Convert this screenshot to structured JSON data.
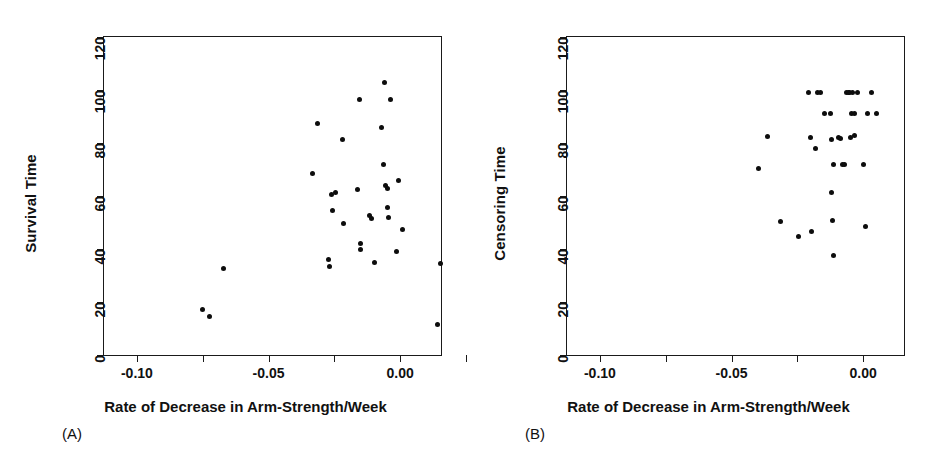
{
  "figure": {
    "panels": [
      {
        "tag": "(A)",
        "ylabel": "Survival Time",
        "xlabel": "Rate of Decrease in Arm-Strength/Week"
      },
      {
        "tag": "(B)",
        "ylabel": "Censoring Time",
        "xlabel": "Rate of Decrease in Arm-Strength/Week"
      }
    ]
  },
  "chart_data": [
    {
      "type": "scatter",
      "panel": "(A)",
      "title": "",
      "xlabel": "Rate of Decrease in Arm-Strength/Week",
      "ylabel": "Survival Time",
      "xlim": [
        -0.1125,
        0.0155
      ],
      "ylim": [
        0,
        120
      ],
      "xticks": [
        -0.1,
        -0.075,
        -0.05,
        -0.025,
        0.0,
        0.025
      ],
      "xticklabels": [
        "-0.10",
        "",
        "-0.05",
        "",
        "0.00",
        ""
      ],
      "yticks": [
        0,
        20,
        40,
        60,
        80,
        100,
        120
      ],
      "yticklabels": [
        "0",
        "20",
        "40",
        "60",
        "80",
        "100",
        "120"
      ],
      "grid": false,
      "legend": null,
      "marker": "filled-circle",
      "marker_color": "#0d0d0d",
      "points": [
        {
          "x": -0.0752,
          "y": 17.0
        },
        {
          "x": -0.0723,
          "y": 14.5
        },
        {
          "x": -0.0672,
          "y": 32.5
        },
        {
          "x": -0.0334,
          "y": 68.5
        },
        {
          "x": -0.0313,
          "y": 87.5
        },
        {
          "x": -0.0271,
          "y": 36.0
        },
        {
          "x": -0.0269,
          "y": 33.5
        },
        {
          "x": -0.0261,
          "y": 60.5
        },
        {
          "x": -0.0256,
          "y": 54.5
        },
        {
          "x": -0.0245,
          "y": 61.5
        },
        {
          "x": -0.0219,
          "y": 81.5
        },
        {
          "x": -0.0214,
          "y": 49.5
        },
        {
          "x": -0.0161,
          "y": 62.5
        },
        {
          "x": -0.0155,
          "y": 96.5
        },
        {
          "x": -0.0151,
          "y": 42.0
        },
        {
          "x": -0.0149,
          "y": 40.0
        },
        {
          "x": -0.0116,
          "y": 52.5
        },
        {
          "x": -0.011,
          "y": 51.5
        },
        {
          "x": -0.0098,
          "y": 34.8
        },
        {
          "x": -0.0071,
          "y": 86.0
        },
        {
          "x": -0.0064,
          "y": 72.0
        },
        {
          "x": -0.0059,
          "y": 103.0
        },
        {
          "x": -0.0055,
          "y": 64.0
        },
        {
          "x": -0.005,
          "y": 63.0
        },
        {
          "x": -0.0047,
          "y": 55.5
        },
        {
          "x": -0.0044,
          "y": 52.0
        },
        {
          "x": -0.0036,
          "y": 96.5
        },
        {
          "x": -0.0014,
          "y": 39.0
        },
        {
          "x": -0.0008,
          "y": 66.0
        },
        {
          "x": 0.0008,
          "y": 47.5
        },
        {
          "x": 0.0152,
          "y": 34.5
        },
        {
          "x": 0.014,
          "y": 11.5
        }
      ]
    },
    {
      "type": "scatter",
      "panel": "(B)",
      "title": "",
      "xlabel": "Rate of Decrease in Arm-Strength/Week",
      "ylabel": "Censoring Time",
      "xlim": [
        -0.1125,
        0.0155
      ],
      "ylim": [
        0,
        120
      ],
      "xticks": [
        -0.1,
        -0.075,
        -0.05,
        -0.025,
        0.0,
        0.025
      ],
      "xticklabels": [
        "-0.10",
        "",
        "-0.05",
        "",
        "0.00",
        ""
      ],
      "yticks": [
        0,
        20,
        40,
        60,
        80,
        100,
        120
      ],
      "yticklabels": [
        "0",
        "20",
        "40",
        "60",
        "80",
        "100",
        "120"
      ],
      "grid": false,
      "legend": null,
      "marker": "filled-circle",
      "marker_color": "#0d0d0d",
      "points": [
        {
          "x": -0.0398,
          "y": 70.5
        },
        {
          "x": -0.0362,
          "y": 82.5
        },
        {
          "x": -0.0315,
          "y": 50.5
        },
        {
          "x": -0.0247,
          "y": 44.8
        },
        {
          "x": -0.0207,
          "y": 99.0
        },
        {
          "x": -0.0201,
          "y": 82.0
        },
        {
          "x": -0.0196,
          "y": 46.5
        },
        {
          "x": -0.018,
          "y": 77.8
        },
        {
          "x": -0.0173,
          "y": 99.0
        },
        {
          "x": -0.0164,
          "y": 99.0
        },
        {
          "x": -0.0146,
          "y": 91.0
        },
        {
          "x": -0.0126,
          "y": 91.0
        },
        {
          "x": -0.0122,
          "y": 61.5
        },
        {
          "x": -0.012,
          "y": 81.5
        },
        {
          "x": -0.0117,
          "y": 50.8
        },
        {
          "x": -0.0113,
          "y": 72.0
        },
        {
          "x": -0.0112,
          "y": 37.5
        },
        {
          "x": -0.0095,
          "y": 82.0
        },
        {
          "x": -0.0087,
          "y": 81.8
        },
        {
          "x": -0.0078,
          "y": 72.0
        },
        {
          "x": -0.0072,
          "y": 72.0
        },
        {
          "x": -0.0064,
          "y": 99.0
        },
        {
          "x": -0.0056,
          "y": 99.0
        },
        {
          "x": -0.0051,
          "y": 99.0
        },
        {
          "x": -0.0049,
          "y": 82.0
        },
        {
          "x": -0.0045,
          "y": 91.0
        },
        {
          "x": -0.004,
          "y": 99.0
        },
        {
          "x": -0.0034,
          "y": 82.8
        },
        {
          "x": -0.0032,
          "y": 91.0
        },
        {
          "x": -0.0023,
          "y": 99.0
        },
        {
          "x": 0.0003,
          "y": 72.0
        },
        {
          "x": 0.0009,
          "y": 48.5
        },
        {
          "x": 0.0016,
          "y": 91.0
        },
        {
          "x": 0.0032,
          "y": 99.0
        },
        {
          "x": 0.0052,
          "y": 91.0
        }
      ]
    }
  ]
}
